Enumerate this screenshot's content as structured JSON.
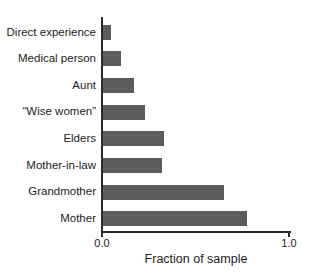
{
  "figure": {
    "background": "#ffffff"
  },
  "chart_data": {
    "type": "bar",
    "orientation": "horizontal",
    "categories": [
      "Direct experience",
      "Medical person",
      "Aunt",
      "“Wise women”",
      "Elders",
      "Mother-in-law",
      "Grandmother",
      "Mother"
    ],
    "values": [
      0.05,
      0.1,
      0.17,
      0.23,
      0.33,
      0.32,
      0.65,
      0.77
    ],
    "title": "",
    "xlabel": "Fraction of sample",
    "ylabel": "",
    "xlim": [
      0.0,
      1.0
    ],
    "x_tick_labels": [
      "0.0",
      "1.0"
    ],
    "x_tick_values": [
      0.0,
      1.0
    ],
    "grid": false,
    "legend": "none",
    "bar_color": "#5c5c5c",
    "axis_color": "#2b2b2b",
    "text_color": "#1d1d1d"
  }
}
